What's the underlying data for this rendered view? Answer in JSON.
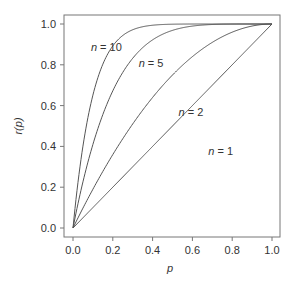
{
  "chart_data": {
    "type": "line",
    "title": "",
    "xlabel": "p",
    "ylabel": "r(p)",
    "xlim": [
      0,
      1
    ],
    "ylim": [
      0,
      1
    ],
    "grid": false,
    "legend": "none (inline curve labels)",
    "x_ticks": [
      "0.0",
      "0.2",
      "0.4",
      "0.6",
      "0.8",
      "1.0"
    ],
    "y_ticks": [
      "0.0",
      "0.2",
      "0.4",
      "0.6",
      "0.8",
      "1.0"
    ],
    "function": "r(p) = 1 - (1 - p)^n",
    "x": [
      0.0,
      0.05,
      0.1,
      0.15,
      0.2,
      0.3,
      0.4,
      0.5,
      0.6,
      0.7,
      0.8,
      0.9,
      1.0
    ],
    "series": [
      {
        "name": "n = 1",
        "n": 1,
        "values": [
          0.0,
          0.05,
          0.1,
          0.15,
          0.2,
          0.3,
          0.4,
          0.5,
          0.6,
          0.7,
          0.8,
          0.9,
          1.0
        ]
      },
      {
        "name": "n = 2",
        "n": 2,
        "values": [
          0.0,
          0.098,
          0.19,
          0.278,
          0.36,
          0.51,
          0.64,
          0.75,
          0.84,
          0.91,
          0.96,
          0.99,
          1.0
        ]
      },
      {
        "name": "n = 5",
        "n": 5,
        "values": [
          0.0,
          0.226,
          0.41,
          0.556,
          0.672,
          0.832,
          0.922,
          0.969,
          0.99,
          0.998,
          1.0,
          1.0,
          1.0
        ]
      },
      {
        "name": "n = 10",
        "n": 10,
        "values": [
          0.0,
          0.401,
          0.651,
          0.803,
          0.893,
          0.972,
          0.994,
          0.999,
          1.0,
          1.0,
          1.0,
          1.0,
          1.0
        ]
      }
    ],
    "annotations": [
      {
        "text_n": "n",
        "text_rest": " = 10",
        "x": 0.09,
        "y": 0.87
      },
      {
        "text_n": "n",
        "text_rest": " = 5",
        "x": 0.33,
        "y": 0.79
      },
      {
        "text_n": "n",
        "text_rest": " = 2",
        "x": 0.53,
        "y": 0.55
      },
      {
        "text_n": "n",
        "text_rest": " = 1",
        "x": 0.68,
        "y": 0.36
      }
    ]
  },
  "style": {
    "line_color": "#555555",
    "axis_color": "#666666",
    "text_color": "#333333"
  }
}
